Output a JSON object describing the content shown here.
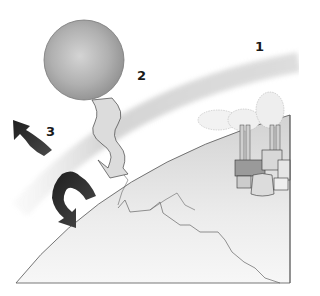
{
  "diagram": {
    "labels": [
      {
        "id": "1",
        "text": "1",
        "refers_to": "atmosphere-band",
        "x": 255,
        "y": 40
      },
      {
        "id": "2",
        "text": "2",
        "refers_to": "incoming-solar-radiation",
        "x": 137,
        "y": 69
      },
      {
        "id": "3",
        "text": "3",
        "refers_to": "reflected-infrared-radiation",
        "x": 46,
        "y": 125
      }
    ],
    "elements": {
      "sun": "grey sphere",
      "atmosphere": "light grey curved band",
      "incoming_arrow": "light grey wavy arrow from sun toward earth",
      "outgoing_arrows": "dark wavy arrows bouncing off atmosphere and earth",
      "earth": "curved earth surface section with country borders",
      "factory": "industrial plant with smoking chimneys and cooling towers"
    },
    "colors": {
      "background": "#ffffff",
      "sun": "#a9a9a9",
      "atmosphere": "#d6d6d6",
      "incoming_arrow": "#d9d9d9",
      "outgoing_arrow": "#2b2b2b",
      "earth_fill": "#e6e6e6",
      "outline": "#555555"
    }
  }
}
